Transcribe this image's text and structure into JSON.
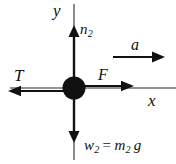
{
  "figure": {
    "kind": "free-body-diagram",
    "title": "",
    "background_color": "#ffffff",
    "stroke_color": "#111111",
    "body": {
      "name": "particle-mass-2",
      "shape": "filled-circle",
      "center_x": 74,
      "center_y": 88,
      "radius": 11,
      "fill": "#111111"
    },
    "axes": [
      {
        "id": "y-axis",
        "label": "y",
        "orientation": "vertical",
        "x1": 74,
        "y1": 4,
        "x2": 74,
        "y2": 160,
        "label_x": 53,
        "label_y": 2
      },
      {
        "id": "x-axis",
        "label": "x",
        "orientation": "horizontal",
        "x1": 10,
        "y1": 88,
        "x2": 176,
        "y2": 88,
        "label_x": 148,
        "label_y": 92
      }
    ],
    "vectors": [
      {
        "id": "normal-force",
        "symbol": "n",
        "subscript": "2",
        "direction": "up",
        "x1": 74,
        "y1": 88,
        "x2": 74,
        "y2": 28,
        "label_x": 80,
        "label_y": 22
      },
      {
        "id": "tension-force",
        "symbol": "T",
        "subscript": "",
        "direction": "left",
        "x1": 74,
        "y1": 88,
        "x2": 8,
        "y2": 92,
        "label_x": 14,
        "label_y": 67
      },
      {
        "id": "applied-force",
        "symbol": "F",
        "subscript": "",
        "direction": "right",
        "x1": 74,
        "y1": 88,
        "x2": 133,
        "y2": 86,
        "label_x": 98,
        "label_y": 67
      },
      {
        "id": "weight-force",
        "symbol": "w",
        "subscript": "2",
        "direction": "down",
        "x1": 74,
        "y1": 88,
        "x2": 74,
        "y2": 142,
        "label_x": 84,
        "label_y": 138
      },
      {
        "id": "acceleration",
        "symbol": "a",
        "subscript": "",
        "direction": "right",
        "x1": 113,
        "y1": 57,
        "x2": 164,
        "y2": 57,
        "label_x": 131,
        "label_y": 37
      }
    ],
    "labels": {
      "y_axis": "y",
      "x_axis": "x",
      "normal": "n",
      "normal_sub": "2",
      "tension": "T",
      "force": "F",
      "acceleration": "a",
      "weight": "w",
      "weight_sub": "2",
      "equals": "=",
      "mass": "m",
      "mass_sub": "2",
      "gravity": "g",
      "weight_equation": "w2 = m2 g"
    }
  }
}
